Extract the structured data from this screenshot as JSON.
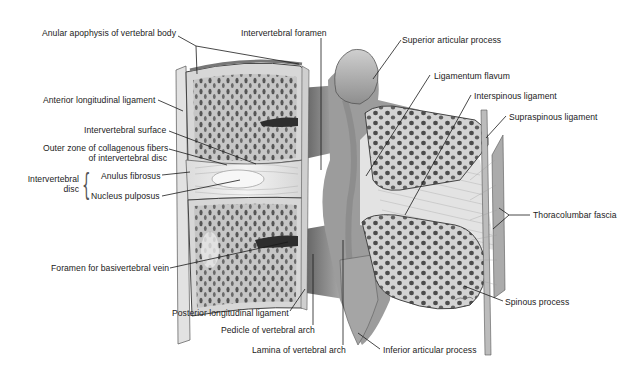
{
  "figure": {
    "type": "anatomical-illustration",
    "signature": "signature-mark",
    "colors": {
      "background": "#ffffff",
      "bone_cortex": "#d9d9d9",
      "cancellous_fill": "#bdbdbd",
      "cancellous_holes": "#4a4a4a",
      "disc": "#ececec",
      "shadow": "#555555",
      "leader_line": "#1a1a1a",
      "text": "#222222"
    }
  },
  "labels": {
    "anular_apophysis": "Anular apophysis of vertebral body",
    "intervertebral_foramen": "Intervertebral foramen",
    "superior_articular_process": "Superior articular process",
    "ligamentum_flavum": "Ligamentum flavum",
    "interspinous_ligament": "Interspinous ligament",
    "supraspinous_ligament": "Supraspinous ligament",
    "anterior_longitudinal_ligament": "Anterior longitudinal ligament",
    "intervertebral_surface": "Intervertebral surface",
    "outer_zone_line1": "Outer zone of collagenous fibers",
    "outer_zone_line2": "of intervertebral disc",
    "intervertebral_disc_line1": "Intervertebral",
    "intervertebral_disc_line2": "disc",
    "anulus_fibrosus": "Anulus fibrosus",
    "nucleus_pulposus": "Nucleus pulposus",
    "thoracolumbar_fascia": "Thoracolumbar fascia",
    "foramen_basivertebral_vein": "Foramen for basivertebral vein",
    "spinous_process": "Spinous process",
    "posterior_longitudinal_ligament": "Posterior longitudinal ligament",
    "pedicle_vertebral_arch": "Pedicle of vertebral arch",
    "lamina_vertebral_arch": "Lamina of vertebral arch",
    "inferior_articular_process": "Inferior articular process"
  }
}
